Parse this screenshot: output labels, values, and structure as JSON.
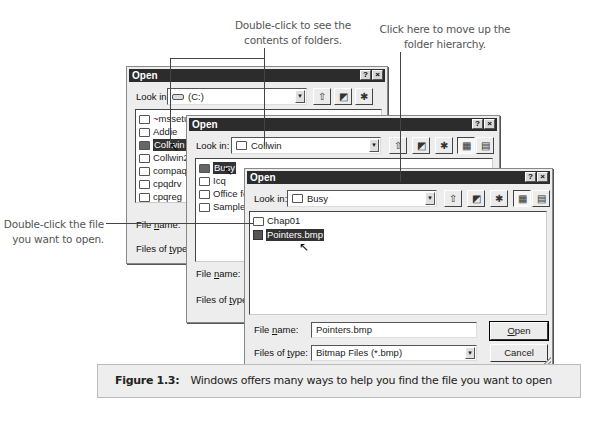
{
  "callouts": {
    "top_left": "Double-click to see the contents of folders.",
    "top_left_line1": "Double-click to see the",
    "top_left_line2": "contents of folders.",
    "top_right_line1": "Click here to move up the",
    "top_right_line2": "folder hierarchy.",
    "left_line1": "Double-click the file",
    "left_line2": "you want to open."
  },
  "dialogs": [
    {
      "title": "Open",
      "look_in_label": "Look in:",
      "look_in_value": "(C:)",
      "look_in_icon": "drive-icon",
      "items": [
        "~mssetup.t",
        "Addie",
        "Collwin",
        "Collwin2",
        "compaq",
        "cpqdrv",
        "cpqreg"
      ],
      "items_col2": [
        "Hiwi",
        "Program Files"
      ],
      "selected": "Collwin",
      "file_name_label": "File name:",
      "files_of_type_label": "Files of type:"
    },
    {
      "title": "Open",
      "look_in_label": "Look in:",
      "look_in_value": "Collwin",
      "look_in_icon": "folder-icon",
      "items": [
        "Busy",
        "Icq",
        "Office for",
        "Sample"
      ],
      "selected": "Busy",
      "file_name_label": "File name:",
      "files_of_type_label": "Files of type:"
    },
    {
      "title": "Open",
      "look_in_label": "Look in:",
      "look_in_value": "Busy",
      "look_in_icon": "folder-icon",
      "items": [
        "Chap01",
        "Pointers.bmp"
      ],
      "selected": "Pointers.bmp",
      "file_name_label": "File name:",
      "file_name_value": "Pointers.bmp",
      "files_of_type_label": "Files of type:",
      "files_of_type_value": "Bitmap Files (*.bmp)",
      "open_button": "Open",
      "cancel_button": "Cancel"
    }
  ],
  "title_buttons": {
    "help": "?",
    "close": "×"
  },
  "toolbar_icons": [
    "up-one-level-icon",
    "desktop-icon",
    "new-folder-icon",
    "list-view-icon",
    "details-view-icon"
  ],
  "caption": {
    "label": "Figure 1.3:",
    "text": "Windows offers many ways to help you find the file you want to open"
  }
}
